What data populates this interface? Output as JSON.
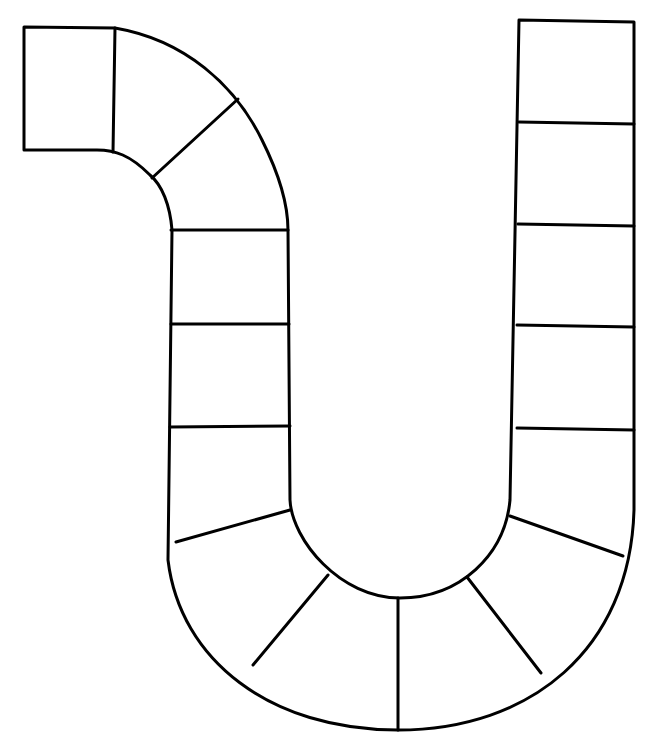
{
  "board": {
    "type": "blank game board path template",
    "space_count": 21,
    "stroke_color": "#000000",
    "background": "#ffffff"
  }
}
